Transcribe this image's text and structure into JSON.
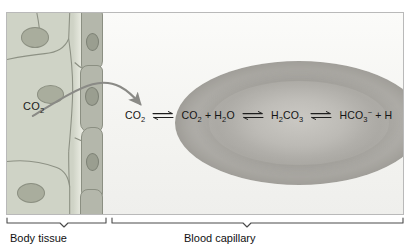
{
  "figure": {
    "type": "biology-diagram"
  },
  "labels": {
    "co2_tissue": "CO",
    "co2_tissue_sub": "2",
    "body_tissue": "Body tissue",
    "blood_capillary": "Blood capillary"
  },
  "equation": {
    "full_text": "CO2 ⇌ CO2 + H2O ⇌ H2CO3 ⇌ HCO3- + H",
    "terms": [
      {
        "base": "CO",
        "sub": "2",
        "sup": "",
        "trailing": ""
      },
      {
        "base": "CO",
        "sub": "2",
        "sup": "",
        "trailing": " + H"
      },
      {
        "base": "",
        "sub": "2",
        "sup": "",
        "trailing": "O"
      },
      {
        "base": "H",
        "sub": "2",
        "sup": "",
        "trailing": "CO"
      },
      {
        "base": "",
        "sub": "3",
        "sup": "",
        "trailing": ""
      },
      {
        "base": "HCO",
        "sub": "3",
        "sup": "−",
        "trailing": " + H"
      }
    ],
    "t1": "CO",
    "t1sub": "2",
    "t2a": "CO",
    "t2sub": "2",
    "t2b": " + H",
    "t2sub2": "2",
    "t2c": "O",
    "t3a": "H",
    "t3sub": "2",
    "t3b": "CO",
    "t3sub2": "3",
    "t4a": "HCO",
    "t4sub": "3",
    "t4sup": "−",
    "t4b": " + H",
    "arrow_symbol": "⇌",
    "arrow_count": 3,
    "note_truncated_right": true
  },
  "icons": {
    "diffusion_arrow": "curved-arrow-icon",
    "equilibrium_arrow": "equilibrium-arrow-icon",
    "brace_left": "brace-icon",
    "brace_right": "brace-icon"
  },
  "colors": {
    "panel_background": "#f7f7f5",
    "panel_border": "#b9b9b9",
    "tissue_fill": "#cfd3c6",
    "tissue_outline": "#8d9184",
    "tissue_nucleus": "#a9ad9d",
    "endothelium_fill": "#b4b7ab",
    "endothelium_outline": "#8b8f82",
    "endothelium_nucleus": "#9a9e90",
    "rbc_outer": "#a8a6a1",
    "rbc_inner": "#c6c4bf",
    "arrow": "#8a8a86",
    "text": "#141414",
    "brace": "#4a4a4a"
  },
  "geometry": {
    "panel": {
      "x": 6,
      "y": 12,
      "w": 398,
      "h": 203
    },
    "tissue_region": {
      "x": 6,
      "y": 12,
      "w": 74,
      "h": 203
    },
    "capillary_wall": {
      "x": 78,
      "y": 12,
      "w": 20,
      "h": 203
    },
    "rbc": {
      "cx": 292,
      "cy": 122,
      "rx": 124,
      "ry": 62
    }
  }
}
